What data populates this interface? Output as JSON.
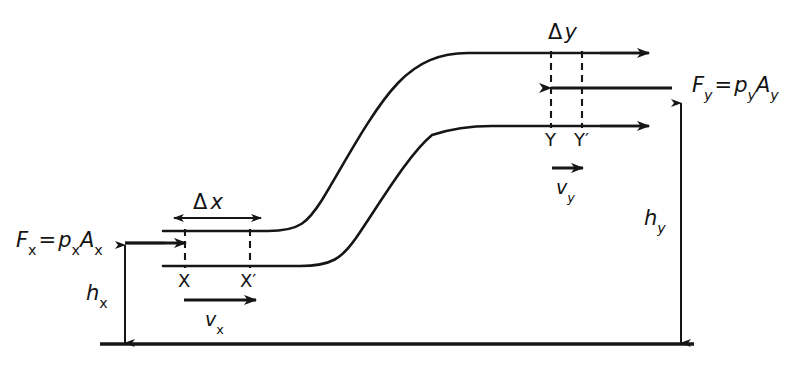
{
  "figure": {
    "name": "bernoulli-flow-tube-diagram",
    "stroke_color": "#161616",
    "background": "#ffffff"
  },
  "labels": {
    "force_in": {
      "id": "F-x-equals-p-x-A-x",
      "symbol": "F",
      "symbol_sub": "x",
      "operator": "=",
      "rhs_first": "p",
      "rhs_first_sub": "x",
      "rhs_second": "A",
      "rhs_second_sub": "x",
      "plain": "F_x = p_x A_x"
    },
    "force_out": {
      "id": "F-y-equals-p-y-A-y",
      "symbol": "F",
      "symbol_sub": "y",
      "operator": "=",
      "rhs_first": "p",
      "rhs_first_sub": "y",
      "rhs_second": "A",
      "rhs_second_sub": "y",
      "plain": "F_y = p_y A_y"
    },
    "delta_x": {
      "delta": "Δ",
      "var": "x",
      "plain": "Δx"
    },
    "delta_y": {
      "delta": "Δ",
      "var": "y",
      "plain": "Δy"
    },
    "height_x": {
      "symbol": "h",
      "sub": "x",
      "plain": "h_x"
    },
    "height_y": {
      "symbol": "h",
      "sub": "y",
      "plain": "h_y"
    },
    "velocity_x": {
      "symbol": "v",
      "sub": "x",
      "plain": "v_x"
    },
    "velocity_y": {
      "symbol": "v",
      "sub": "y",
      "plain": "v_y"
    },
    "point_x": "X",
    "point_x_prime": "X′",
    "point_y": "Y",
    "point_y_prime": "Y′"
  },
  "geometry": {
    "ground_line_y": 344,
    "ground_line_x_start": 100,
    "ground_line_x_end": 694,
    "lower_pipe_top_y": 231,
    "lower_pipe_bottom_y": 266,
    "upper_pipe_top_y": 53,
    "upper_pipe_bottom_y": 126,
    "section_x_left": 185,
    "section_x_right": 250,
    "section_y_left": 551,
    "section_y_right": 582
  }
}
